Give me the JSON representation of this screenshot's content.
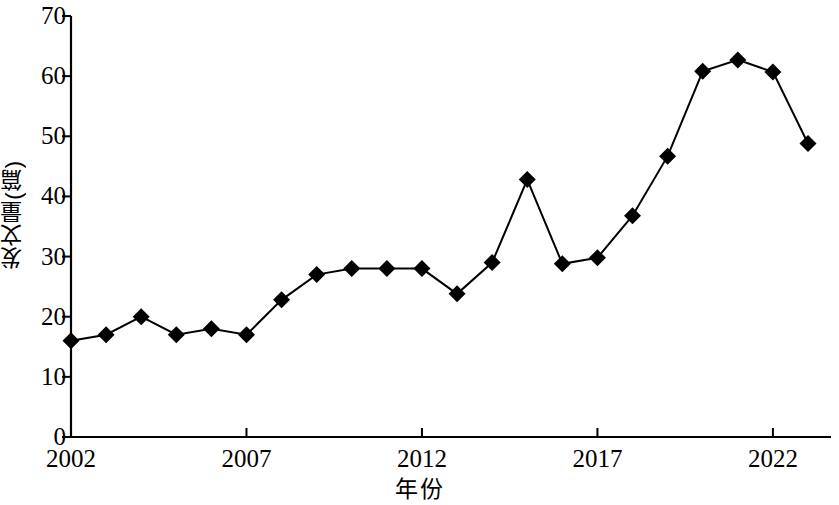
{
  "chart_data": {
    "type": "line",
    "title": "",
    "xlabel": "年份",
    "ylabel": "发文量(篇)",
    "x": [
      2002,
      2003,
      2004,
      2005,
      2006,
      2007,
      2008,
      2009,
      2010,
      2011,
      2012,
      2013,
      2014,
      2015,
      2016,
      2017,
      2018,
      2019,
      2020,
      2021,
      2022,
      2023
    ],
    "values": [
      16,
      17,
      20,
      17,
      18,
      17,
      22.8,
      27,
      28,
      28,
      28,
      23.8,
      29,
      42.8,
      28.8,
      29.8,
      36.8,
      46.7,
      60.8,
      62.7,
      60.7,
      48.8
    ],
    "series": [
      {
        "name": "发文量(篇)",
        "values": [
          16,
          17,
          20,
          17,
          18,
          17,
          22.8,
          27,
          28,
          28,
          28,
          23.8,
          29,
          42.8,
          28.8,
          29.8,
          36.8,
          46.7,
          60.8,
          62.7,
          60.7,
          48.8
        ]
      }
    ],
    "xlim": [
      2002,
      2023
    ],
    "ylim": [
      0,
      70
    ],
    "ytick_labels": [
      "0",
      "10",
      "20",
      "30",
      "40",
      "50",
      "60",
      "70"
    ],
    "ytick_values": [
      0,
      10,
      20,
      30,
      40,
      50,
      60,
      70
    ],
    "xtick_labels": [
      "2002",
      "2007",
      "2012",
      "2017",
      "2022"
    ],
    "xtick_values": [
      2002,
      2007,
      2012,
      2017,
      2022
    ],
    "grid": false,
    "legend": false,
    "marker": "diamond",
    "marker_color": "#000000",
    "line_color": "#000000",
    "background_color": "#ffffff"
  }
}
